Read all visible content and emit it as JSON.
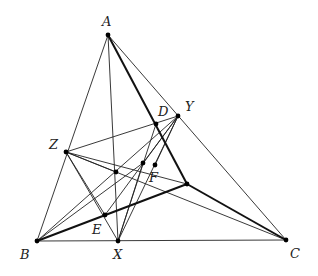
{
  "diagram": {
    "title": "",
    "points": {
      "A": {
        "label": "A",
        "x": 108,
        "y": 35,
        "lx": 102,
        "ly": 26
      },
      "B": {
        "label": "B",
        "x": 37,
        "y": 241,
        "lx": 20,
        "ly": 259
      },
      "C": {
        "label": "C",
        "x": 286,
        "y": 240,
        "lx": 290,
        "ly": 258
      },
      "X": {
        "label": "X",
        "x": 118,
        "y": 241,
        "lx": 114,
        "ly": 259
      },
      "Y": {
        "label": "Y",
        "x": 178,
        "y": 116,
        "lx": 185,
        "ly": 111
      },
      "Z": {
        "label": "Z",
        "x": 66,
        "y": 152,
        "lx": 50,
        "ly": 148
      },
      "D": {
        "label": "D",
        "x": 156,
        "y": 124,
        "lx": 158,
        "ly": 115
      },
      "E": {
        "label": "E",
        "x": 105,
        "y": 215,
        "lx": 92,
        "ly": 233
      },
      "F": {
        "label": "F",
        "x": 155,
        "y": 165,
        "lx": 148,
        "ly": 182
      },
      "P": {
        "label": "",
        "x": 187,
        "y": 184
      },
      "Q": {
        "label": "",
        "x": 116,
        "y": 172
      },
      "R": {
        "label": "",
        "x": 143,
        "y": 163
      }
    },
    "labels": {
      "A": "A",
      "B": "B",
      "C": "C",
      "X": "X",
      "Y": "Y",
      "Z": "Z",
      "D": "D",
      "E": "E",
      "F": "F"
    },
    "thin_segments": [
      [
        "A",
        "B"
      ],
      [
        "A",
        "X"
      ],
      [
        "A",
        "C"
      ],
      [
        "B",
        "C"
      ],
      [
        "Z",
        "X"
      ],
      [
        "Z",
        "Y"
      ],
      [
        "Z",
        "C"
      ],
      [
        "Z",
        "F"
      ],
      [
        "B",
        "Y"
      ],
      [
        "Y",
        "E"
      ],
      [
        "Y",
        "X"
      ],
      [
        "Y",
        "Q"
      ],
      [
        "D",
        "X"
      ],
      [
        "Z",
        "Q"
      ],
      [
        "R",
        "X"
      ]
    ],
    "thick_segments": [
      [
        "A",
        "P"
      ],
      [
        "P",
        "C"
      ],
      [
        "B",
        "P"
      ]
    ]
  }
}
